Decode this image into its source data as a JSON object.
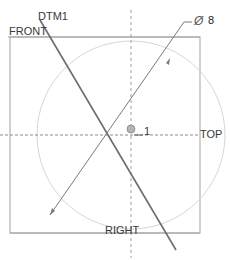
{
  "sketch": {
    "datums": {
      "front": "FRONT",
      "top": "TOP",
      "right": "RIGHT",
      "dtm": "DTM1"
    },
    "dimension": {
      "symbol": "Ø",
      "value": "8"
    },
    "point_label": "1",
    "colors": {
      "frame": "#9a9a9a",
      "circle": "#d4d4d4",
      "datum_line": "#6e6e6e",
      "dashed_axis": "#8a8a8a",
      "dimension_line": "#7a7a7a",
      "text": "#3a3a3a"
    }
  }
}
